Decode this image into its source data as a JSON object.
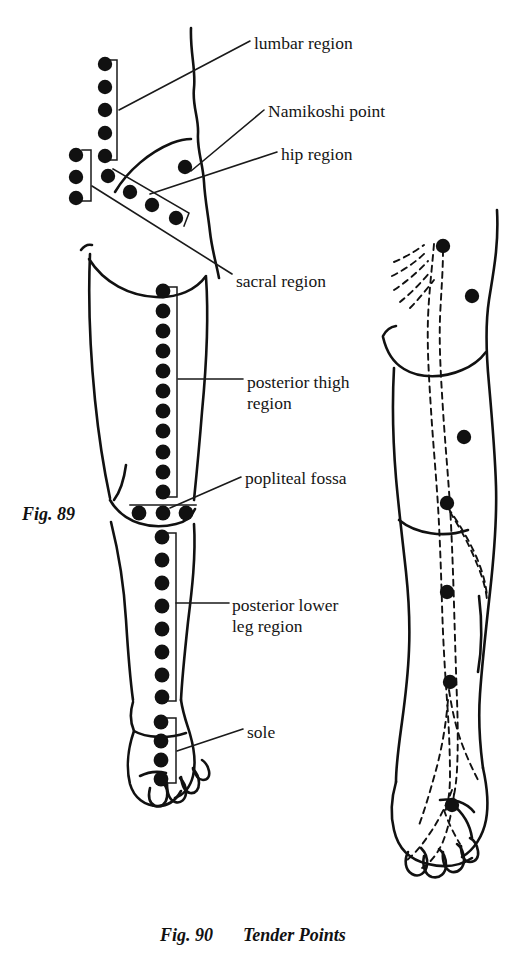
{
  "figure": {
    "background": "#ffffff",
    "ink": "#111111",
    "dot_color": "#111111"
  },
  "labels": [
    {
      "id": "lumbar",
      "text": "lumbar region",
      "x": 254,
      "y": 33,
      "lines": 1
    },
    {
      "id": "namikoshi",
      "text": "Namikoshi point",
      "x": 268,
      "y": 101,
      "lines": 1
    },
    {
      "id": "hip",
      "text": "hip region",
      "x": 281,
      "y": 144,
      "lines": 1
    },
    {
      "id": "sacral",
      "text": "sacral region",
      "x": 236,
      "y": 271,
      "lines": 1
    },
    {
      "id": "post-thigh",
      "text": "posterior thigh\nregion",
      "x": 247,
      "y": 372,
      "lines": 2
    },
    {
      "id": "popliteal",
      "text": "popliteal fossa",
      "x": 245,
      "y": 468,
      "lines": 1
    },
    {
      "id": "post-lower-leg",
      "text": "posterior lower\nleg region",
      "x": 232,
      "y": 595,
      "lines": 2
    },
    {
      "id": "sole",
      "text": "sole",
      "x": 247,
      "y": 722,
      "lines": 1
    }
  ],
  "captions": {
    "left": {
      "text": "Fig. 89",
      "x": 22,
      "y": 504
    },
    "right_number": {
      "text": "Fig. 90",
      "x": 160,
      "y": 925
    },
    "right_title": {
      "text": "Tender Points",
      "x": 243,
      "y": 925
    }
  },
  "point_groups": [
    {
      "id": "lumbar-region-points",
      "label": "lumbar region",
      "count": 5,
      "orientation": "vertical",
      "radius": 7.2,
      "points": [
        {
          "x": 105,
          "y": 64
        },
        {
          "x": 105,
          "y": 87
        },
        {
          "x": 105,
          "y": 110
        },
        {
          "x": 105,
          "y": 133
        },
        {
          "x": 105,
          "y": 156
        }
      ],
      "bracket": {
        "x1": 117,
        "y1": 60,
        "x2": 117,
        "y2": 160,
        "tick": 9,
        "side": "right"
      }
    },
    {
      "id": "sacral-region-points",
      "label": "sacral region",
      "count": 3,
      "orientation": "vertical",
      "radius": 7.2,
      "points": [
        {
          "x": 76,
          "y": 155
        },
        {
          "x": 76,
          "y": 177
        },
        {
          "x": 76,
          "y": 198
        }
      ],
      "bracket": {
        "x1": 90,
        "y1": 150,
        "x2": 90,
        "y2": 201,
        "tick": 9,
        "side": "right"
      }
    },
    {
      "id": "hip-region-points",
      "label": "hip region",
      "count": 4,
      "orientation": "diagonal",
      "radius": 7.2,
      "points": [
        {
          "x": 108,
          "y": 176
        },
        {
          "x": 130,
          "y": 192
        },
        {
          "x": 152,
          "y": 205
        },
        {
          "x": 176,
          "y": 218
        }
      ],
      "bracket": {
        "polyline": "114,170 188,213 188,228"
      }
    },
    {
      "id": "namikoshi-point",
      "label": "Namikoshi point",
      "count": 1,
      "orientation": "single",
      "radius": 7.2,
      "points": [
        {
          "x": 185,
          "y": 167
        }
      ]
    },
    {
      "id": "posterior-thigh-points",
      "label": "posterior thigh region",
      "count": 11,
      "orientation": "vertical",
      "radius": 7.4,
      "points": [
        {
          "x": 163,
          "y": 291
        },
        {
          "x": 163,
          "y": 311
        },
        {
          "x": 163,
          "y": 331
        },
        {
          "x": 163,
          "y": 351
        },
        {
          "x": 163,
          "y": 371
        },
        {
          "x": 163,
          "y": 391
        },
        {
          "x": 163,
          "y": 411
        },
        {
          "x": 163,
          "y": 431
        },
        {
          "x": 163,
          "y": 452
        },
        {
          "x": 163,
          "y": 472
        },
        {
          "x": 163,
          "y": 492
        }
      ],
      "bracket": {
        "x1": 177,
        "y1": 287,
        "x2": 177,
        "y2": 497,
        "tick": 9,
        "side": "right"
      }
    },
    {
      "id": "popliteal-fossa-points",
      "label": "popliteal fossa",
      "count": 3,
      "orientation": "horizontal",
      "radius": 7.4,
      "points": [
        {
          "x": 139,
          "y": 513
        },
        {
          "x": 163,
          "y": 513
        },
        {
          "x": 186,
          "y": 513
        }
      ]
    },
    {
      "id": "posterior-lower-leg-points",
      "label": "posterior lower leg region",
      "count": 8,
      "orientation": "vertical",
      "radius": 7.4,
      "points": [
        {
          "x": 162,
          "y": 537
        },
        {
          "x": 162,
          "y": 560
        },
        {
          "x": 162,
          "y": 583
        },
        {
          "x": 162,
          "y": 606
        },
        {
          "x": 162,
          "y": 629
        },
        {
          "x": 162,
          "y": 652
        },
        {
          "x": 162,
          "y": 675
        },
        {
          "x": 162,
          "y": 697
        }
      ],
      "bracket": {
        "x1": 176,
        "y1": 533,
        "x2": 176,
        "y2": 701,
        "tick": 9,
        "side": "right"
      }
    },
    {
      "id": "sole-points",
      "label": "sole",
      "count": 4,
      "orientation": "vertical",
      "radius": 7.4,
      "points": [
        {
          "x": 161,
          "y": 722
        },
        {
          "x": 161,
          "y": 741
        },
        {
          "x": 161,
          "y": 760
        },
        {
          "x": 161,
          "y": 779
        }
      ],
      "bracket": {
        "x1": 176,
        "y1": 718,
        "x2": 176,
        "y2": 783,
        "tick": 9,
        "side": "right"
      }
    },
    {
      "id": "fig90-tender-points",
      "label": "Fig. 90 tender points along sciatic nerve",
      "count": 6,
      "orientation": "scattered",
      "radius": 7.2,
      "points": [
        {
          "x": 443,
          "y": 246
        },
        {
          "x": 472,
          "y": 296
        },
        {
          "x": 464,
          "y": 437
        },
        {
          "x": 447,
          "y": 503
        },
        {
          "x": 447,
          "y": 592
        },
        {
          "x": 450,
          "y": 682
        },
        {
          "x": 452,
          "y": 805
        }
      ]
    }
  ],
  "leader_lines": [
    {
      "id": "lumbar-leader",
      "path": "M 250,41  L 119,110"
    },
    {
      "id": "namikoshi-leader",
      "path": "M 264,110 L 191,170"
    },
    {
      "id": "hip-leader",
      "path": "M 277,152 L 152,193"
    },
    {
      "id": "sacral-leader",
      "path": "M 232,276 L 92,186"
    },
    {
      "id": "post-thigh-leader",
      "path": "M 243,379 L 178,379"
    },
    {
      "id": "popliteal-leader",
      "path": "M 241,477 L 168,508"
    },
    {
      "id": "lower-leg-leader",
      "path": "M 229,603 L 176,603"
    },
    {
      "id": "sole-leader",
      "path": "M 243,729 L 176,751"
    }
  ],
  "dashed_nerve_paths": {
    "id": "sciatic-nerve-dashed",
    "description": "dashed sciatic nerve tracing on Fig. 90"
  }
}
